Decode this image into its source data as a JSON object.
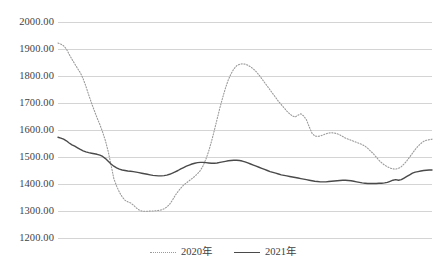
{
  "chart_data": {
    "type": "line",
    "title": "",
    "subtitle": "",
    "xlabel": "",
    "ylabel": "",
    "ylim": [
      1200,
      2000
    ],
    "ytick_step": 100,
    "ytick_labels": [
      "2000.00",
      "1900.00",
      "1800.00",
      "1700.00",
      "1600.00",
      "1500.00",
      "1400.00",
      "1300.00",
      "1200.00"
    ],
    "ytick_values": [
      2000,
      1900,
      1800,
      1700,
      1600,
      1500,
      1400,
      1300,
      1200
    ],
    "grid": true,
    "xaxis_visible": false,
    "xtick_labels": [],
    "legend_position": "bottom-center",
    "series": [
      {
        "name": "2020年",
        "style": "dotted",
        "color": "#9a9a9a",
        "values": [
          1922,
          1918,
          1912,
          1900,
          1880,
          1862,
          1845,
          1828,
          1812,
          1790,
          1762,
          1730,
          1700,
          1672,
          1645,
          1620,
          1592,
          1560,
          1520,
          1470,
          1420,
          1392,
          1370,
          1352,
          1340,
          1334,
          1330,
          1322,
          1312,
          1304,
          1300,
          1299,
          1299,
          1300,
          1300,
          1301,
          1302,
          1304,
          1308,
          1315,
          1325,
          1340,
          1358,
          1372,
          1385,
          1396,
          1404,
          1412,
          1420,
          1428,
          1438,
          1450,
          1468,
          1492,
          1522,
          1558,
          1598,
          1640,
          1682,
          1720,
          1755,
          1785,
          1808,
          1826,
          1838,
          1843,
          1845,
          1844,
          1840,
          1834,
          1826,
          1816,
          1804,
          1790,
          1776,
          1762,
          1748,
          1734,
          1720,
          1706,
          1694,
          1682,
          1670,
          1660,
          1652,
          1648,
          1655,
          1660,
          1652,
          1638,
          1612,
          1588,
          1578,
          1576,
          1578,
          1582,
          1586,
          1589,
          1590,
          1589,
          1586,
          1582,
          1576,
          1570,
          1566,
          1562,
          1558,
          1554,
          1550,
          1546,
          1540,
          1532,
          1522,
          1512,
          1500,
          1488,
          1478,
          1470,
          1464,
          1459,
          1456,
          1455,
          1458,
          1464,
          1474,
          1486,
          1500,
          1514,
          1528,
          1540,
          1550,
          1558,
          1562,
          1564,
          1566
        ]
      },
      {
        "name": "2021年",
        "style": "solid",
        "color": "#4a4a4a",
        "values": [
          1573,
          1570,
          1566,
          1560,
          1552,
          1545,
          1540,
          1534,
          1528,
          1523,
          1519,
          1516,
          1514,
          1512,
          1510,
          1507,
          1502,
          1494,
          1484,
          1474,
          1466,
          1460,
          1455,
          1452,
          1450,
          1448,
          1447,
          1446,
          1444,
          1442,
          1440,
          1438,
          1436,
          1434,
          1432,
          1431,
          1430,
          1430,
          1431,
          1433,
          1436,
          1440,
          1445,
          1450,
          1456,
          1461,
          1466,
          1470,
          1474,
          1477,
          1479,
          1480,
          1480,
          1479,
          1478,
          1477,
          1477,
          1478,
          1480,
          1482,
          1484,
          1486,
          1487,
          1488,
          1488,
          1487,
          1485,
          1482,
          1478,
          1474,
          1470,
          1466,
          1462,
          1458,
          1454,
          1450,
          1446,
          1443,
          1440,
          1437,
          1434,
          1432,
          1430,
          1428,
          1426,
          1424,
          1422,
          1420,
          1418,
          1416,
          1414,
          1412,
          1410,
          1409,
          1408,
          1408,
          1408,
          1409,
          1410,
          1411,
          1412,
          1413,
          1414,
          1414,
          1413,
          1412,
          1410,
          1408,
          1406,
          1404,
          1403,
          1402,
          1402,
          1402,
          1402,
          1403,
          1403,
          1404,
          1406,
          1410,
          1414,
          1416,
          1414,
          1416,
          1422,
          1428,
          1434,
          1440,
          1444,
          1446,
          1448,
          1450,
          1451,
          1452,
          1452
        ]
      }
    ]
  },
  "legend": {
    "entries": [
      {
        "label": "2020年",
        "style": "dotted"
      },
      {
        "label": "2021年",
        "style": "solid"
      }
    ]
  }
}
